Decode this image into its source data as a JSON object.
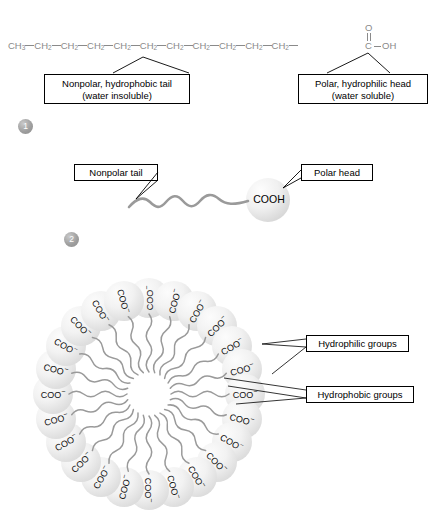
{
  "panel1": {
    "formula": {
      "ch3": "CH",
      "ch3_sub": "3",
      "ch2": "CH",
      "ch2_sub": "2",
      "ch2_count": 10,
      "carboxyl": {
        "o": "O",
        "c": "C",
        "oh": "OH"
      }
    },
    "callouts": [
      {
        "id": "nonpolar-tail",
        "line1": "Nonpolar, hydrophobic tail",
        "line2": "(water insoluble)"
      },
      {
        "id": "polar-head",
        "line1": "Polar, hydrophilic head",
        "line2": "(water soluble)"
      }
    ]
  },
  "dividers": [
    {
      "number": "1"
    },
    {
      "number": "2"
    }
  ],
  "panel2": {
    "head_label": "COOH",
    "callouts": [
      {
        "id": "nonpolar-tail-2",
        "label": "Nonpolar tail"
      },
      {
        "id": "polar-head-2",
        "label": "Polar head"
      }
    ]
  },
  "panel3": {
    "head_label": "COO",
    "head_charge": "−",
    "unit_count": 24,
    "callouts": [
      {
        "id": "hydrophilic",
        "label": "Hydrophilic groups"
      },
      {
        "id": "hydrophobic",
        "label": "Hydrophobic groups"
      }
    ]
  },
  "colors": {
    "formula_gray": "#8a8a8a",
    "tail_gray": "#9a9a9a",
    "sphere_gray": "#dedede",
    "divider_gray": "#b8b8b8",
    "text_black": "#000000"
  }
}
